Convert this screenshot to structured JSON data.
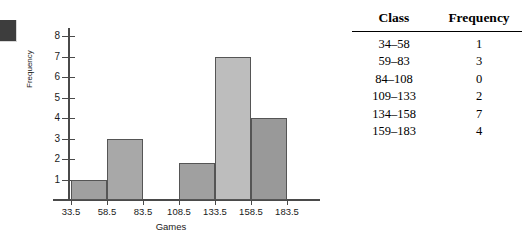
{
  "marker": {
    "name": "dark-square-marker",
    "color": "#3d3d3d"
  },
  "chart_data": {
    "type": "bar",
    "title": "",
    "subtitle": "",
    "xlabel": "Games",
    "ylabel": "Frequency",
    "grid": false,
    "legend": false,
    "ylim": [
      0,
      8.4
    ],
    "yticks": [
      1,
      2,
      3,
      4,
      5,
      6,
      7,
      8
    ],
    "xticks": [
      "33.5",
      "58.5",
      "83.5",
      "108.5",
      "133.5",
      "158.5",
      "183.5"
    ],
    "bin_edges": [
      33.5,
      58.5,
      83.5,
      108.5,
      133.5,
      158.5,
      183.5
    ],
    "categories": [
      "33.5-58.5",
      "58.5-83.5",
      "83.5-108.5",
      "108.5-133.5",
      "133.5-158.5",
      "158.5-183.5"
    ],
    "values": [
      1,
      3,
      0,
      1.8,
      7,
      4
    ],
    "bar_colors": [
      "#a0a0a0",
      "#a8a8a8",
      "#ffffff",
      "#a0a0a0",
      "#bdbdbd",
      "#999999"
    ],
    "bar_border_color": "#555555",
    "axis_color": "#4a4a4a"
  },
  "table": {
    "headers": {
      "class": "Class",
      "frequency": "Frequency"
    },
    "rows": [
      {
        "class": "34–58",
        "frequency": "1"
      },
      {
        "class": "59–83",
        "frequency": "3"
      },
      {
        "class": "84–108",
        "frequency": "0"
      },
      {
        "class": "109–133",
        "frequency": "2"
      },
      {
        "class": "134–158",
        "frequency": "7"
      },
      {
        "class": "159–183",
        "frequency": "4"
      }
    ]
  }
}
